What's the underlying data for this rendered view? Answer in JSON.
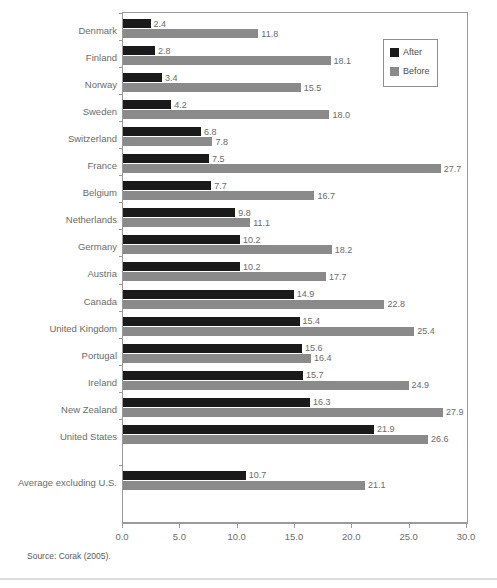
{
  "figure": {
    "source_note": "Source: Corak (2005).",
    "title_faint": "",
    "colors": {
      "after": "#1a1a1a",
      "before": "#8a8a8a",
      "axis": "#9a9a9a",
      "text": "#6b6b6b",
      "background": "#ffffff"
    }
  },
  "legend": {
    "position": "top-right",
    "entries": [
      {
        "label": "After",
        "color": "#1a1a1a",
        "swatch": "legend-swatch-after"
      },
      {
        "label": "Before",
        "color": "#8a8a8a",
        "swatch": "legend-swatch-before"
      }
    ]
  },
  "chart_data": {
    "type": "bar",
    "orientation": "horizontal",
    "title": "",
    "subtitle": "",
    "xlabel": "",
    "ylabel": "",
    "xlim": [
      0.0,
      30.0
    ],
    "xticks": [
      0.0,
      5.0,
      10.0,
      15.0,
      20.0,
      25.0,
      30.0
    ],
    "xtick_labels": [
      "0.0",
      "5.0",
      "10.0",
      "15.0",
      "20.0",
      "25.0",
      "30.0"
    ],
    "grid": false,
    "legend_position": "top-right",
    "categories": [
      "Denmark",
      "Finland",
      "Norway",
      "Sweden",
      "Switzerland",
      "France",
      "Belgium",
      "Netherlands",
      "Germany",
      "Austria",
      "Canada",
      "United Kingdom",
      "Portugal",
      "Ireland",
      "New Zealand",
      "United States",
      "Average excluding U.S."
    ],
    "series": [
      {
        "name": "After",
        "color": "#1a1a1a",
        "values": [
          2.4,
          2.8,
          3.4,
          4.2,
          6.8,
          7.5,
          7.7,
          9.8,
          10.2,
          10.2,
          14.9,
          15.4,
          15.6,
          15.7,
          16.3,
          21.9,
          10.7
        ],
        "labels": [
          "2.4",
          "2.8",
          "3.4",
          "4.2",
          "6.8",
          "7.5",
          "7.7",
          "9.8",
          "10.2",
          "10.2",
          "14.9",
          "15.4",
          "15.6",
          "15.7",
          "16.3",
          "21.9",
          "10.7"
        ]
      },
      {
        "name": "Before",
        "color": "#8a8a8a",
        "values": [
          11.8,
          18.1,
          15.5,
          18.0,
          7.8,
          27.7,
          16.7,
          11.1,
          18.2,
          17.7,
          22.8,
          25.4,
          16.4,
          24.9,
          27.9,
          26.6,
          21.1
        ],
        "labels": [
          "11.8",
          "18.1",
          "15.5",
          "18.0",
          "7.8",
          "27.7",
          "16.7",
          "11.1",
          "18.2",
          "17.7",
          "22.8",
          "25.4",
          "16.4",
          "24.9",
          "27.9",
          "26.6",
          "21.1"
        ]
      }
    ]
  }
}
